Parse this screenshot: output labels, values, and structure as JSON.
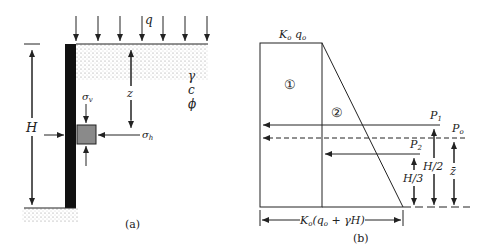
{
  "panel_a": {
    "caption": "(a)",
    "surcharge_label": "q",
    "height_label": "H",
    "depth_label": "z",
    "soil_props": [
      "γ",
      "c",
      "ϕ"
    ],
    "sigma_v_label": "σv",
    "sigma_h_label": "σh",
    "colors": {
      "wall": "#111111",
      "element": "#8a8a8a",
      "line": "#222222"
    }
  },
  "panel_b": {
    "caption": "(b)",
    "top_label": "Kₒ qₒ",
    "region_1": "①",
    "region_2": "②",
    "force_p1": "P₁",
    "force_po": "Pₒ",
    "force_p2": "P₂",
    "dim_h2": "H/2",
    "dim_h3": "H/3",
    "dim_zbar": "z̄",
    "base_label": "Kₒ(qₒ + γH)"
  }
}
